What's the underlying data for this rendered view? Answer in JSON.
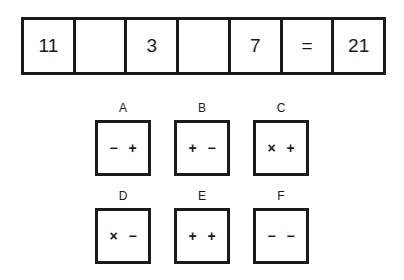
{
  "equation": {
    "cells": [
      "11",
      "",
      "3",
      "",
      "7",
      "=",
      "21"
    ]
  },
  "options": [
    {
      "label": "A",
      "symbols": [
        "−",
        "+"
      ]
    },
    {
      "label": "B",
      "symbols": [
        "+",
        "−"
      ]
    },
    {
      "label": "C",
      "symbols": [
        "×",
        "+"
      ]
    },
    {
      "label": "D",
      "symbols": [
        "×",
        "−"
      ]
    },
    {
      "label": "E",
      "symbols": [
        "+",
        "+"
      ]
    },
    {
      "label": "F",
      "symbols": [
        "−",
        "−"
      ]
    }
  ]
}
